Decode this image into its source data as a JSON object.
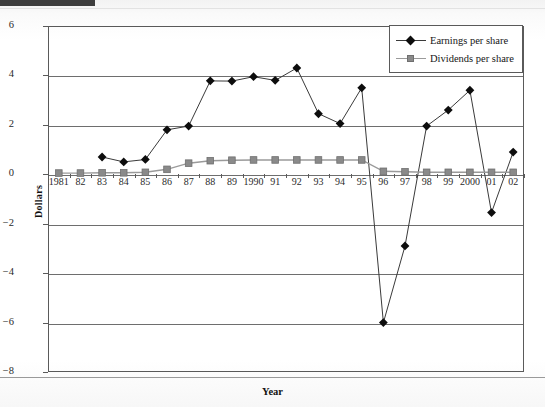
{
  "page": {
    "top_bar_color": "#3d3d3d"
  },
  "chart_data": {
    "type": "line",
    "title": "",
    "xlabel": "Year",
    "ylabel": "Dollars",
    "ylim": [
      -8,
      6
    ],
    "yticks": [
      6,
      4,
      2,
      0,
      -2,
      -4,
      -6,
      -8
    ],
    "ytick_labels": [
      "6",
      "4",
      "2",
      "0",
      "−2",
      "−4",
      "−6",
      "−8"
    ],
    "grid": true,
    "legend_position": "top-right",
    "categories": [
      "1981",
      "82",
      "83",
      "84",
      "85",
      "86",
      "87",
      "88",
      "89",
      "1990",
      "91",
      "92",
      "93",
      "94",
      "95",
      "96",
      "97",
      "98",
      "99",
      "2000",
      "01",
      "02"
    ],
    "series": [
      {
        "name": "Earnings per share",
        "marker": "diamond",
        "color": "#0d0d0d",
        "line_color": "#3a3a3a",
        "values": [
          null,
          null,
          0.7,
          0.5,
          0.6,
          1.8,
          1.95,
          3.78,
          3.77,
          3.95,
          3.8,
          4.3,
          2.45,
          2.05,
          3.5,
          -6.0,
          -2.9,
          1.95,
          2.6,
          3.4,
          -1.55,
          0.9
        ]
      },
      {
        "name": "Dividends per share",
        "marker": "square",
        "color": "#8a8a8a",
        "line_color": "#9a9a9a",
        "values": [
          0.05,
          0.05,
          0.06,
          0.06,
          0.08,
          0.2,
          0.45,
          0.55,
          0.57,
          0.58,
          0.58,
          0.58,
          0.58,
          0.58,
          0.58,
          0.12,
          0.1,
          0.08,
          0.08,
          0.08,
          0.08,
          0.08
        ]
      }
    ]
  },
  "legend": {
    "items": [
      {
        "label": "Earnings per share",
        "marker": "diamond-marker"
      },
      {
        "label": "Dividends per share",
        "marker": "square-marker"
      }
    ]
  }
}
